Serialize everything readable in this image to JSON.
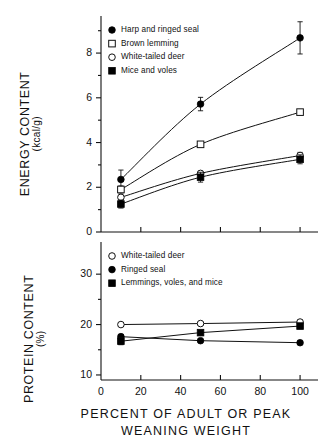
{
  "figure": {
    "background": "#ffffff",
    "ink": "#111111",
    "marker_fill_open": "#ffffff",
    "marker_fill_solid": "#000000"
  },
  "xaxis": {
    "title_lines": [
      "PERCENT OF ADULT OR PEAK",
      "WEANING WEIGHT"
    ],
    "ticks": [
      0,
      20,
      40,
      60,
      80,
      100
    ],
    "tick_labels": [
      "0",
      "20",
      "40",
      "60",
      "80",
      "100"
    ],
    "range": [
      0,
      108
    ]
  },
  "panels": {
    "top": {
      "ylabel_main": "ENERGY CONTENT",
      "ylabel_sub": "(kcal/g)",
      "ytick_labels": [
        "0",
        "2",
        "4",
        "6",
        "8"
      ],
      "legend": [
        {
          "label": "Harp and ringed seal",
          "marker": "filled-circle"
        },
        {
          "label": "Brown lemming",
          "marker": "open-square"
        },
        {
          "label": "White-tailed deer",
          "marker": "open-circle"
        },
        {
          "label": "Mice and voles",
          "marker": "filled-square"
        }
      ]
    },
    "bottom": {
      "ylabel_main": "PROTEIN CONTENT",
      "ylabel_sub": "(%)",
      "ytick_labels": [
        "10",
        "20",
        "30"
      ],
      "legend": [
        {
          "label": "White-tailed deer",
          "marker": "open-circle"
        },
        {
          "label": "Ringed seal",
          "marker": "filled-circle"
        },
        {
          "label": "Lemmings, voles, and mice",
          "marker": "filled-square"
        }
      ]
    }
  },
  "chart_data": [
    {
      "type": "line",
      "panel": "top",
      "title": "",
      "xlabel": "PERCENT OF ADULT OR PEAK WEANING WEIGHT",
      "ylabel": "ENERGY CONTENT (kcal/g)",
      "x": [
        10,
        50,
        100
      ],
      "xlim": [
        0,
        108
      ],
      "ylim": [
        0,
        9.3
      ],
      "yticks": [
        0,
        2,
        4,
        6,
        8
      ],
      "xticks": [
        0,
        20,
        40,
        60,
        80,
        100
      ],
      "grid": false,
      "legend_position": "top-left-inside",
      "series": [
        {
          "name": "Harp and ringed seal",
          "marker": "filled-circle",
          "values": [
            2.35,
            5.72,
            8.68
          ],
          "errors": [
            0.42,
            0.3,
            0.72
          ]
        },
        {
          "name": "Brown lemming",
          "marker": "open-square",
          "values": [
            1.9,
            3.92,
            5.36
          ],
          "errors": [
            0.16,
            0.05,
            0.05
          ]
        },
        {
          "name": "White-tailed deer",
          "marker": "open-circle",
          "values": [
            1.55,
            2.62,
            3.42
          ],
          "errors": [
            0.1,
            0.1,
            0.14
          ]
        },
        {
          "name": "Mice and voles",
          "marker": "filled-square",
          "values": [
            1.25,
            2.45,
            3.25
          ],
          "errors": [
            0.18,
            0.22,
            0.2
          ]
        }
      ]
    },
    {
      "type": "line",
      "panel": "bottom",
      "title": "",
      "xlabel": "PERCENT OF ADULT OR PEAK WEANING WEIGHT",
      "ylabel": "PROTEIN CONTENT (%)",
      "x": [
        10,
        50,
        100
      ],
      "xlim": [
        0,
        108
      ],
      "ylim": [
        9,
        34
      ],
      "yticks": [
        10,
        20,
        30
      ],
      "xticks": [
        0,
        20,
        40,
        60,
        80,
        100
      ],
      "grid": false,
      "legend_position": "top-left-inside",
      "series": [
        {
          "name": "White-tailed deer",
          "marker": "open-circle",
          "values": [
            20.0,
            20.2,
            20.5
          ],
          "errors": [
            0.3,
            0.3,
            0.4
          ]
        },
        {
          "name": "Ringed seal",
          "marker": "filled-circle",
          "values": [
            17.6,
            16.8,
            16.4
          ],
          "errors": [
            0.4,
            0.3,
            0.3
          ]
        },
        {
          "name": "Lemmings, voles, and mice",
          "marker": "filled-square",
          "values": [
            16.7,
            18.4,
            19.7
          ],
          "errors": [
            0.7,
            0.4,
            0.5
          ]
        }
      ]
    }
  ]
}
